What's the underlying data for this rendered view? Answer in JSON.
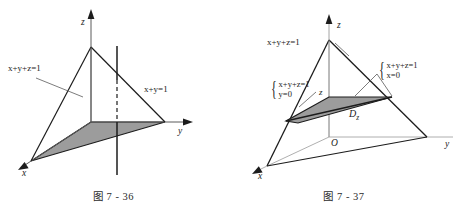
{
  "figures": [
    {
      "id": "fig-7-36",
      "caption": "图 7 - 36",
      "axes": {
        "x": "x",
        "y": "y",
        "z": "z"
      },
      "labels": {
        "plane_xyz": "x+y+z=1",
        "plane_xy": "x+y=1"
      },
      "colors": {
        "stroke": "#1c1c1c",
        "shade_fill": "#9c9c9c",
        "axis": "#5a5a5a",
        "background": "#ffffff"
      },
      "description": "Tetrahedron cut by plane x+y+z=1 with shaded projection triangle in the xy-plane and a vertical line x+y=1"
    },
    {
      "id": "fig-7-37",
      "caption": "图 7 - 37",
      "axes": {
        "x": "x",
        "y": "y",
        "z": "z",
        "origin": "O"
      },
      "labels": {
        "plane_xyz": "x+y+z=1",
        "height_mark": "z",
        "region": "Dz",
        "region_sub": "z",
        "region_main": "D",
        "brace_left_top": "x+y+z=1",
        "brace_left_bottom": "y=0",
        "brace_right_top": "x+y+z=1",
        "brace_right_bottom": "x=0"
      },
      "colors": {
        "stroke": "#1c1c1c",
        "shade_fill": "#9c9c9c",
        "axis": "#8a8a8a",
        "background": "#ffffff"
      },
      "description": "Tetrahedron with horizontal cross-section slice Dz at height z"
    }
  ]
}
